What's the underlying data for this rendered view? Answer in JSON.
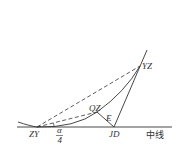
{
  "diagram": {
    "type": "road-curve-geometry",
    "labels": {
      "zy": "ZY",
      "yz": "YZ",
      "qz": "QZ",
      "jd": "JD",
      "e": "E",
      "alpha": "α",
      "four": "4",
      "centerline": "中线"
    },
    "colors": {
      "line": "#333333",
      "background": "#ffffff"
    },
    "points": {
      "ZY": [
        37,
        127
      ],
      "JD": [
        114,
        127
      ],
      "YZ": [
        140,
        66
      ],
      "QZ": [
        97,
        112
      ]
    }
  }
}
